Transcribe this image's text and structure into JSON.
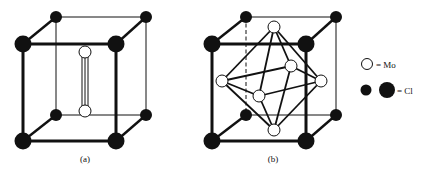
{
  "figure": {
    "panels": [
      {
        "id": "a",
        "label": "(a)",
        "description": "Cl cube with Mo2 unit inside"
      },
      {
        "id": "b",
        "label": "(b)",
        "description": "Cl cube with Mo6 octahedron inside"
      }
    ],
    "legend": {
      "mo_label": "= Mo",
      "cl_label": "= Cl"
    },
    "colors": {
      "line": "#111111",
      "cl_fill": "#111111",
      "mo_fill": "#ffffff",
      "background": "#ffffff"
    }
  }
}
